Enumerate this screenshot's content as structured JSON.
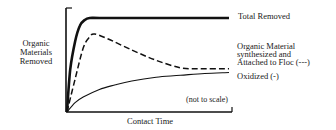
{
  "chart_data": {
    "type": "line",
    "title": "",
    "xlabel": "Contact Time",
    "ylabel": [
      "Organic",
      "Materials",
      "Removed"
    ],
    "annotation": "(not to scale)",
    "xlim": [
      0,
      1
    ],
    "ylim": [
      0,
      1
    ],
    "grid": false,
    "legend_placement": "right (inline labels at line ends)",
    "series": [
      {
        "name": "Total Removed",
        "label_lines": [
          "Total Removed"
        ],
        "style": "solid-thick",
        "x": [
          0,
          0.02,
          0.05,
          0.08,
          0.11,
          0.14,
          0.2,
          0.4,
          0.7,
          1.0
        ],
        "y": [
          0,
          0.45,
          0.75,
          0.92,
          0.98,
          1.0,
          1.0,
          1.0,
          1.0,
          1.0
        ]
      },
      {
        "name": "Organic Material synthesized and Attached to Floc (---)",
        "label_lines": [
          "Organic Material",
          "synthesized and",
          "Attached to Floc (---)"
        ],
        "style": "dashed",
        "x": [
          0,
          0.05,
          0.1,
          0.14,
          0.17,
          0.25,
          0.4,
          0.55,
          0.7,
          0.8,
          1.0
        ],
        "y": [
          0,
          0.35,
          0.68,
          0.8,
          0.83,
          0.78,
          0.66,
          0.55,
          0.47,
          0.46,
          0.46
        ]
      },
      {
        "name": "Oxidized (-)",
        "label_lines": [
          "Oxidized (-)"
        ],
        "style": "solid-thin",
        "x": [
          0,
          0.05,
          0.1,
          0.2,
          0.3,
          0.4,
          0.55,
          0.7,
          0.85,
          1.0
        ],
        "y": [
          0,
          0.1,
          0.16,
          0.24,
          0.29,
          0.33,
          0.37,
          0.39,
          0.41,
          0.42
        ]
      }
    ]
  }
}
